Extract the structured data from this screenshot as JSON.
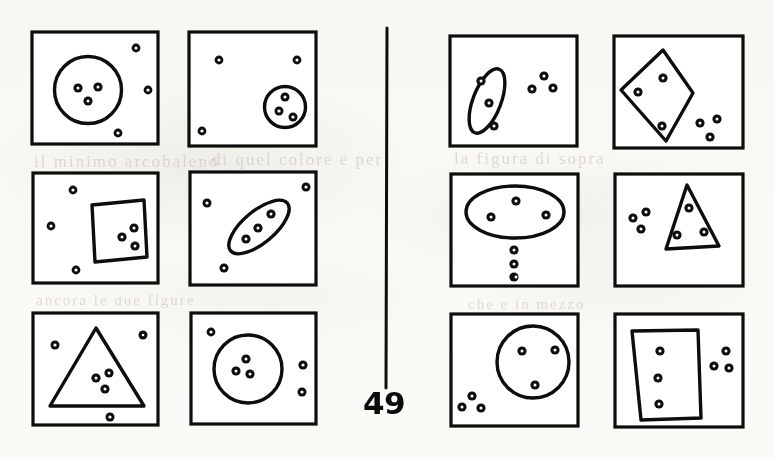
{
  "page": {
    "page_number": "49",
    "background_color": "#fdfdfb",
    "ink_color": "#0d0d0d",
    "width": 774,
    "height": 460
  },
  "divider": {
    "name": "vertical-rule",
    "x": 387,
    "y_top": 28,
    "y_bottom": 388
  },
  "columns": [
    {
      "name": "left-column",
      "panel_indices": [
        0,
        1,
        2,
        3,
        4,
        5
      ]
    },
    {
      "name": "right-column",
      "panel_indices": [
        6,
        7,
        8,
        9,
        10,
        11
      ]
    }
  ],
  "panels": [
    {
      "id": "panel-1",
      "label": "large-circle-with-three-dots-inside",
      "row": 1,
      "column": 1,
      "side": "left",
      "frame": {
        "x": 32,
        "y": 32,
        "w": 126,
        "h": 112
      },
      "shape": {
        "type": "circle",
        "cx": 88,
        "cy": 90,
        "rx": 34,
        "ry": 33,
        "rotation": 0
      },
      "dots_inside": [
        {
          "x": 78,
          "y": 88
        },
        {
          "x": 98,
          "y": 87
        },
        {
          "x": 88,
          "y": 101
        }
      ],
      "dots_outside": [
        {
          "x": 136,
          "y": 48
        },
        {
          "x": 148,
          "y": 90
        },
        {
          "x": 118,
          "y": 133
        }
      ],
      "dot_count_inside": 3,
      "dot_count_outside": 3
    },
    {
      "id": "panel-2",
      "label": "small-circle-with-three-dots-inside",
      "row": 1,
      "column": 2,
      "side": "left",
      "frame": {
        "x": 189,
        "y": 32,
        "w": 127,
        "h": 114
      },
      "shape": {
        "type": "circle",
        "cx": 285,
        "cy": 107,
        "rx": 21,
        "ry": 20,
        "rotation": 0
      },
      "dots_inside": [
        {
          "x": 285,
          "y": 97
        },
        {
          "x": 279,
          "y": 111
        },
        {
          "x": 293,
          "y": 116
        }
      ],
      "dots_outside": [
        {
          "x": 219,
          "y": 60
        },
        {
          "x": 297,
          "y": 60
        },
        {
          "x": 202,
          "y": 131
        }
      ],
      "dot_count_inside": 3,
      "dot_count_outside": 3
    },
    {
      "id": "panel-3",
      "label": "tilted-square-with-three-dots-inside",
      "row": 2,
      "column": 1,
      "side": "left",
      "frame": {
        "x": 33,
        "y": 173,
        "w": 125,
        "h": 110
      },
      "shape": {
        "type": "polygon",
        "points": "92,205 143,200 146,257 95,261"
      },
      "dots_inside": [
        {
          "x": 122,
          "y": 237
        },
        {
          "x": 133,
          "y": 229
        },
        {
          "x": 134,
          "y": 246
        }
      ],
      "dots_outside": [
        {
          "x": 73,
          "y": 190
        },
        {
          "x": 51,
          "y": 226
        },
        {
          "x": 76,
          "y": 270
        }
      ],
      "dot_count_inside": 3,
      "dot_count_outside": 3
    },
    {
      "id": "panel-4",
      "label": "tilted-ellipse-with-three-dots-inside",
      "row": 2,
      "column": 2,
      "side": "left",
      "frame": {
        "x": 190,
        "y": 172,
        "w": 126,
        "h": 113
      },
      "shape": {
        "type": "ellipse",
        "cx": 259,
        "cy": 227,
        "rx": 37,
        "ry": 16,
        "rotation": -40
      },
      "dots_inside": [
        {
          "x": 246,
          "y": 238
        },
        {
          "x": 258,
          "y": 228
        },
        {
          "x": 270,
          "y": 214
        }
      ],
      "dots_outside": [
        {
          "x": 306,
          "y": 187
        },
        {
          "x": 207,
          "y": 203
        },
        {
          "x": 224,
          "y": 268
        }
      ],
      "dot_count_inside": 3,
      "dot_count_outside": 3
    },
    {
      "id": "panel-5",
      "label": "triangle-with-three-dots-inside",
      "row": 3,
      "column": 1,
      "side": "left",
      "frame": {
        "x": 33,
        "y": 313,
        "w": 125,
        "h": 112
      },
      "shape": {
        "type": "polygon",
        "points": "96,328 143,406 50,406"
      },
      "dots_inside": [
        {
          "x": 96,
          "y": 378
        },
        {
          "x": 109,
          "y": 373
        },
        {
          "x": 105,
          "y": 389
        }
      ],
      "dots_outside": [
        {
          "x": 55,
          "y": 345
        },
        {
          "x": 143,
          "y": 335
        },
        {
          "x": 110,
          "y": 417
        }
      ],
      "dot_count_inside": 3,
      "dot_count_outside": 3
    },
    {
      "id": "panel-6",
      "label": "circle-with-three-dots-inside",
      "row": 3,
      "column": 2,
      "side": "left",
      "frame": {
        "x": 191,
        "y": 313,
        "w": 125,
        "h": 111
      },
      "shape": {
        "type": "circle",
        "cx": 248,
        "cy": 369,
        "rx": 34,
        "ry": 34,
        "rotation": 0
      },
      "dots_inside": [
        {
          "x": 245,
          "y": 360
        },
        {
          "x": 236,
          "y": 371
        },
        {
          "x": 249,
          "y": 374
        }
      ],
      "dots_outside": [
        {
          "x": 211,
          "y": 332
        },
        {
          "x": 303,
          "y": 365
        },
        {
          "x": 302,
          "y": 392
        }
      ],
      "dot_count_inside": 3,
      "dot_count_outside": 3
    },
    {
      "id": "panel-7",
      "label": "narrow-tilted-ellipse-with-three-dots-inside",
      "row": 1,
      "column": 1,
      "side": "right",
      "frame": {
        "x": 450,
        "y": 36,
        "w": 127,
        "h": 110
      },
      "shape": {
        "type": "ellipse",
        "cx": 487,
        "cy": 100,
        "rx": 34,
        "ry": 14,
        "rotation": -69
      },
      "dots_inside": [
        {
          "x": 481,
          "y": 81
        },
        {
          "x": 489,
          "y": 103
        },
        {
          "x": 494,
          "y": 126
        }
      ],
      "dots_outside": [
        {
          "x": 544,
          "y": 76
        },
        {
          "x": 532,
          "y": 88
        },
        {
          "x": 552,
          "y": 88
        }
      ],
      "dot_count_inside": 3,
      "dot_count_outside": 3
    },
    {
      "id": "panel-8",
      "label": "diamond-with-three-dots-inside",
      "row": 1,
      "column": 2,
      "side": "right",
      "frame": {
        "x": 614,
        "y": 36,
        "w": 129,
        "h": 112
      },
      "shape": {
        "type": "polygon",
        "points": "663,50 692,92 665,140 620,90"
      },
      "dots_inside": [
        {
          "x": 663,
          "y": 78
        },
        {
          "x": 638,
          "y": 92
        },
        {
          "x": 662,
          "y": 126
        }
      ],
      "dots_outside": [
        {
          "x": 700,
          "y": 123
        },
        {
          "x": 716,
          "y": 119
        },
        {
          "x": 710,
          "y": 136
        }
      ],
      "dot_count_inside": 3,
      "dot_count_outside": 3
    },
    {
      "id": "panel-9",
      "label": "wide-ellipse-with-three-dots-inside",
      "row": 2,
      "column": 1,
      "side": "right",
      "frame": {
        "x": 451,
        "y": 174,
        "w": 127,
        "h": 112
      },
      "shape": {
        "type": "ellipse",
        "cx": 515,
        "cy": 212,
        "rx": 49,
        "ry": 26,
        "rotation": 0
      },
      "dots_inside": [
        {
          "x": 516,
          "y": 201
        },
        {
          "x": 491,
          "y": 217
        },
        {
          "x": 546,
          "y": 215
        }
      ],
      "dots_outside": [
        {
          "x": 514,
          "y": 250
        },
        {
          "x": 514,
          "y": 264
        },
        {
          "x": 514,
          "y": 277
        }
      ],
      "dot_count_inside": 3,
      "dot_count_outside": 3
    },
    {
      "id": "panel-10",
      "label": "tilted-triangle-with-three-dots-inside",
      "row": 2,
      "column": 2,
      "side": "right",
      "frame": {
        "x": 615,
        "y": 174,
        "w": 128,
        "h": 112
      },
      "shape": {
        "type": "polygon",
        "points": "687,185 718,245 666,248"
      },
      "dots_inside": [
        {
          "x": 689,
          "y": 208
        },
        {
          "x": 677,
          "y": 235
        },
        {
          "x": 704,
          "y": 232
        }
      ],
      "dots_outside": [
        {
          "x": 645,
          "y": 213
        },
        {
          "x": 634,
          "y": 218
        },
        {
          "x": 641,
          "y": 229
        }
      ],
      "dot_count_inside": 3,
      "dot_count_outside": 3
    },
    {
      "id": "panel-11",
      "label": "circle-right-with-three-dots-inside",
      "row": 3,
      "column": 1,
      "side": "right",
      "frame": {
        "x": 451,
        "y": 314,
        "w": 127,
        "h": 112
      },
      "shape": {
        "type": "circle",
        "cx": 533,
        "cy": 362,
        "rx": 36,
        "ry": 36,
        "rotation": 0
      },
      "dots_inside": [
        {
          "x": 522,
          "y": 351
        },
        {
          "x": 555,
          "y": 350
        },
        {
          "x": 535,
          "y": 385
        }
      ],
      "dots_outside": [
        {
          "x": 472,
          "y": 396
        },
        {
          "x": 462,
          "y": 406
        },
        {
          "x": 481,
          "y": 408
        }
      ],
      "dot_count_inside": 3,
      "dot_count_outside": 3
    },
    {
      "id": "panel-12",
      "label": "trapezoid-with-three-dots-inside",
      "row": 3,
      "column": 2,
      "side": "right",
      "frame": {
        "x": 615,
        "y": 314,
        "w": 128,
        "h": 113
      },
      "shape": {
        "type": "polygon",
        "points": "632,331 697,330 700,418 641,420"
      },
      "dots_inside": [
        {
          "x": 660,
          "y": 351
        },
        {
          "x": 658,
          "y": 378
        },
        {
          "x": 659,
          "y": 404
        }
      ],
      "dots_outside": [
        {
          "x": 725,
          "y": 351
        },
        {
          "x": 714,
          "y": 366
        },
        {
          "x": 729,
          "y": 368
        }
      ],
      "dot_count_inside": 3,
      "dot_count_outside": 3
    }
  ],
  "bleed_through": [
    {
      "text": "il minimo arcobaleno",
      "x": 34,
      "y": 152,
      "size": 17
    },
    {
      "text": "di quel colore e per",
      "x": 212,
      "y": 150,
      "size": 17
    },
    {
      "text": "la figura di sopra",
      "x": 454,
      "y": 149,
      "size": 17
    },
    {
      "text": "ancora le due figure",
      "x": 36,
      "y": 292,
      "size": 15
    },
    {
      "text": "che e in mezzo",
      "x": 468,
      "y": 296,
      "size": 15
    }
  ]
}
